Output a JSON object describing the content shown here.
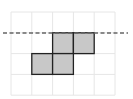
{
  "diagram": {
    "type": "grid-with-shaded-cells",
    "grid": {
      "columns": 5,
      "rows": 4,
      "origin_x": 11,
      "origin_y": 12,
      "cell_size": 20.8,
      "line_color": "#e6e6e6"
    },
    "shaded_cells": [
      {
        "row": 1,
        "col": 2
      },
      {
        "row": 1,
        "col": 3
      },
      {
        "row": 2,
        "col": 1
      },
      {
        "row": 2,
        "col": 2
      }
    ],
    "shade_color": "#c8c8c8",
    "outline_color": "#222222",
    "dashed_line": {
      "y": 33,
      "x_start": 3,
      "x_end": 128,
      "color": "#666666",
      "label": "line of symmetry"
    }
  }
}
